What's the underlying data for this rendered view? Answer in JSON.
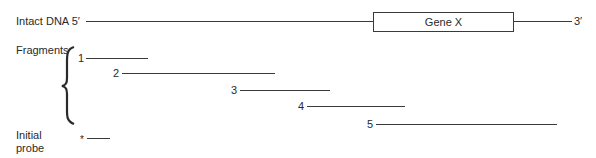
{
  "intact": {
    "label": "Intact DNA 5′",
    "end_label": "3′",
    "gene_label": "Gene X"
  },
  "fragments": {
    "group_label": "Fragments",
    "items": [
      {
        "number": "1"
      },
      {
        "number": "2"
      },
      {
        "number": "3"
      },
      {
        "number": "4"
      },
      {
        "number": "5"
      }
    ]
  },
  "probe": {
    "label_line1": "Initial",
    "label_line2": "probe",
    "marker": "*"
  }
}
